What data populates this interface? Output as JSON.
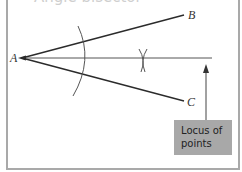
{
  "diagram": {
    "title_partial": "Angle bisector",
    "points": {
      "A": {
        "label": "A",
        "x": 22,
        "y": 58
      },
      "B": {
        "label": "B",
        "x": 184,
        "y": 15
      },
      "C": {
        "label": "C",
        "x": 184,
        "y": 101
      }
    },
    "bisector": {
      "x1": 22,
      "y1": 58,
      "x2": 212,
      "y2": 58
    },
    "callout": {
      "text_line1": "Locus of",
      "text_line2": "points",
      "box_color": "#a8a8a8"
    },
    "colors": {
      "line": "#2b2b2b",
      "arc": "#555555",
      "frame": "#a9a9a9"
    }
  }
}
